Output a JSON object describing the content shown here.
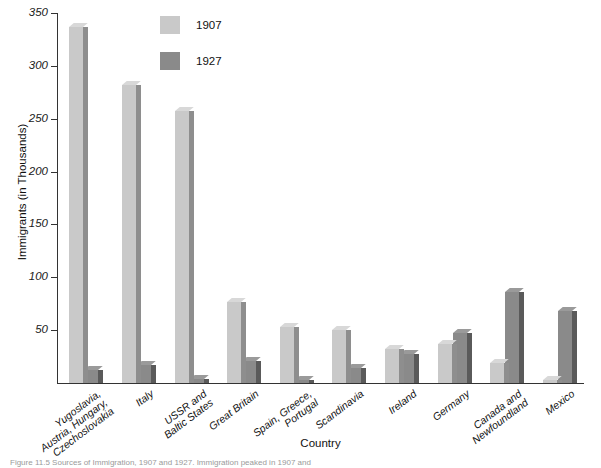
{
  "chart_data": {
    "type": "bar",
    "title": "",
    "xlabel": "Country",
    "ylabel": "Immigrants (in Thousands)",
    "ylim": [
      0,
      350
    ],
    "yticks": [
      50,
      100,
      150,
      200,
      250,
      300,
      350
    ],
    "ytick_labels": [
      "50",
      "100",
      "150",
      "200",
      "250",
      "300",
      "350"
    ],
    "grid": false,
    "legend_position": "top-center-left",
    "categories": [
      "Yugoslavia,\nAustria, Hungary,\nCzechoslovakia",
      "Italy",
      "USSR and\nBaltic States",
      "Great Britain",
      "Spain, Greece,\nPortugal",
      "Scandinavia",
      "Ireland",
      "Germany",
      "Canada and\nNewfoundland",
      "Mexico"
    ],
    "series": [
      {
        "name": "1907",
        "color": "#c9c9c9",
        "values": [
          337,
          282,
          257,
          77,
          53,
          50,
          32,
          37,
          19,
          3
        ]
      },
      {
        "name": "1927",
        "color": "#8a8a8a",
        "values": [
          12,
          17,
          4,
          21,
          3,
          14,
          27,
          47,
          86,
          68
        ]
      }
    ]
  },
  "legend": {
    "items": [
      {
        "label": "1907",
        "color": "#c9c9c9"
      },
      {
        "label": "1927",
        "color": "#8a8a8a"
      }
    ]
  },
  "caption": {
    "text": "Figure 11.5   Sources of Immigration, 1907 and 1927. Immigration peaked in 1907 and"
  }
}
